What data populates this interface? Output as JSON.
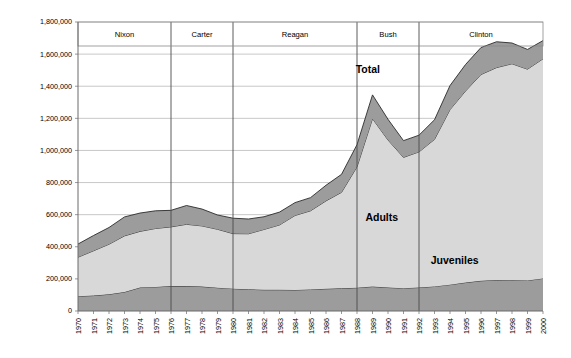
{
  "chart_data": {
    "type": "area",
    "title": "",
    "subtitle": "",
    "xlabel": "",
    "ylabel": "",
    "stacked": true,
    "grid": true,
    "legend_position": "inline-annotations",
    "ylim": [
      0,
      1800000
    ],
    "ytick_step": 200000,
    "ytick_labels": [
      "1,800,000",
      "1,600,000",
      "1,400,000",
      "1,200,000",
      "1,000,000",
      "800,000",
      "600,000",
      "400,000",
      "200,000",
      "0"
    ],
    "ytick_values": [
      1800000,
      1600000,
      1400000,
      1200000,
      1000000,
      800000,
      600000,
      400000,
      200000,
      0
    ],
    "x": [
      1970,
      1971,
      1972,
      1973,
      1974,
      1975,
      1976,
      1977,
      1978,
      1979,
      1980,
      1981,
      1982,
      1983,
      1984,
      1985,
      1986,
      1987,
      1988,
      1989,
      1990,
      1991,
      1992,
      1993,
      1994,
      1995,
      1996,
      1997,
      1998,
      1999,
      2000
    ],
    "xtick_labels": [
      "1970",
      "1971",
      "1972",
      "1973",
      "1974",
      "1975",
      "1976",
      "1977",
      "1978",
      "1979",
      "1980",
      "1981",
      "1982",
      "1983",
      "1984",
      "1985",
      "1986",
      "1987",
      "1988",
      "1989",
      "1990",
      "1991",
      "1992",
      "1993",
      "1994",
      "1995",
      "1996",
      "1997",
      "1998",
      "1999",
      "2000"
    ],
    "series": [
      {
        "name": "Juveniles",
        "color": "#9c9c9c",
        "values": [
          92000,
          96000,
          104000,
          118000,
          146000,
          150000,
          155000,
          155000,
          152000,
          145000,
          139000,
          135000,
          132000,
          132000,
          131000,
          134000,
          138000,
          141000,
          145000,
          152000,
          146000,
          142000,
          146000,
          153000,
          164000,
          177000,
          188000,
          193000,
          191000,
          190000,
          203000
        ]
      },
      {
        "name": "Adults",
        "color": "#d8d8d8",
        "values": [
          243000,
          279000,
          312000,
          350000,
          350000,
          364000,
          369000,
          385000,
          378000,
          364000,
          343000,
          346000,
          376000,
          404000,
          464000,
          490000,
          548000,
          598000,
          753000,
          1046000,
          919000,
          815000,
          845000,
          916000,
          1090000,
          1193000,
          1285000,
          1323000,
          1349000,
          1316000,
          1368000
        ]
      },
      {
        "name": "Total band (upper segment)",
        "color": "#9c9c9c",
        "values": [
          82000,
          95000,
          104000,
          118000,
          114000,
          110000,
          103000,
          117000,
          105000,
          89000,
          96000,
          92000,
          79000,
          80000,
          80000,
          82000,
          97000,
          112000,
          138000,
          148000,
          129000,
          104000,
          104000,
          122000,
          150000,
          165000,
          168000,
          161000,
          129000,
          123000,
          113000
        ]
      }
    ],
    "totals": [
      417000,
      470000,
      520000,
      586000,
      610000,
      624000,
      627000,
      657000,
      635000,
      598000,
      578000,
      573000,
      587000,
      616000,
      675000,
      706000,
      783000,
      851000,
      1036000,
      1346000,
      1194000,
      1061000,
      1095000,
      1191000,
      1404000,
      1535000,
      1641000,
      1677000,
      1669000,
      1629000,
      1684000
    ],
    "annotations": [
      {
        "text": "Total",
        "x": 1988.7,
        "y": 1480000
      },
      {
        "text": "Adults",
        "x": 1989.6,
        "y": 560000
      },
      {
        "text": "Juveniles",
        "x": 1994.3,
        "y": 290000
      }
    ],
    "period_bands": [
      {
        "label": "Nixon",
        "start": 1970,
        "end": 1976
      },
      {
        "label": "Carter",
        "start": 1976,
        "end": 1980
      },
      {
        "label": "Reagan",
        "start": 1980,
        "end": 1988
      },
      {
        "label": "Bush",
        "start": 1988,
        "end": 1992
      },
      {
        "label": "Clinton",
        "start": 1992,
        "end": 2000
      }
    ]
  }
}
